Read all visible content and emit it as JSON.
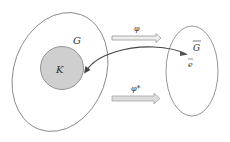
{
  "diagram": {
    "colors": {
      "outline": "#888888",
      "subgroup_fill": "#cfcfcf",
      "subgroup_stroke": "#8a8a8a",
      "arrow_fill": "#e6e6e6",
      "arrow_stroke": "#9a9a9a",
      "curve": "#444444",
      "text": "#333333"
    },
    "labels": {
      "group": "G",
      "subgroup": "K",
      "map": "φ",
      "map_star": "φ*",
      "image_group": "G",
      "identity": "e"
    },
    "nodes": [
      {
        "id": "G",
        "shape": "ellipse",
        "label": "G"
      },
      {
        "id": "K",
        "shape": "circle",
        "label": "K",
        "inside": "G",
        "filled": true
      },
      {
        "id": "Gbar",
        "shape": "ellipse",
        "label": "Ḡ"
      },
      {
        "id": "ebar",
        "shape": "point-label",
        "label": "ē",
        "inside": "Gbar"
      }
    ],
    "edges": [
      {
        "from": "G",
        "to": "Gbar",
        "label": "φ",
        "style": "double-arrow"
      },
      {
        "from": "G",
        "to": "Gbar",
        "label": "φ*",
        "style": "double-arrow"
      },
      {
        "from": "ebar",
        "to": "K",
        "style": "curved-arrow"
      }
    ]
  }
}
